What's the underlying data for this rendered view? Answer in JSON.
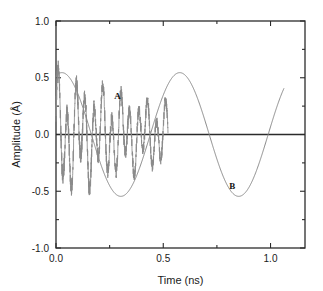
{
  "chart_data": {
    "type": "line",
    "title": "",
    "xlabel": "Time  (ns)",
    "ylabel": "Amplitude  (Å)",
    "xlim": [
      0.0,
      1.1607
    ],
    "ylim": [
      -1.0,
      1.0
    ],
    "grid": false,
    "legend_position": "inline-annotations",
    "xticks": [
      0.0,
      0.5,
      1.0
    ],
    "xticklabels": [
      "0.0",
      "0.5",
      "1.0"
    ],
    "xminorticks": [
      0.25,
      0.75
    ],
    "yticks": [
      -1.0,
      -0.5,
      0.0,
      0.5,
      1.0
    ],
    "yticklabels": [
      "-1.0",
      "-0.5",
      "0.0",
      "0.5",
      "1.0"
    ],
    "yminorticks": [
      -0.75,
      -0.25,
      0.25,
      0.75
    ],
    "series": [
      {
        "name": "A",
        "annotation": "A",
        "annotation_x": 0.287,
        "annotation_y": 0.315,
        "description": "damped high-frequency oscillation",
        "color": "#8a8a8a",
        "x_start": 0.0,
        "x_end": 0.522,
        "frequency_ghz": 24.0,
        "initial_amplitude": 0.4,
        "decay_constant_per_ns": 1.35,
        "noise_amplitude": 0.075
      },
      {
        "name": "B",
        "annotation": "B",
        "annotation_x": 0.822,
        "annotation_y": -0.48,
        "description": "low-frequency sinusoid",
        "color": "#8a8a8a",
        "x_start": 0.0,
        "x_end": 1.062,
        "frequency_ghz": 1.82,
        "amplitude": 0.545,
        "phase_deg": 72.0
      }
    ],
    "zero_line": {
      "y": 0.0,
      "color": "#2b2b2b"
    },
    "frame_color": "#2b2b2b"
  }
}
